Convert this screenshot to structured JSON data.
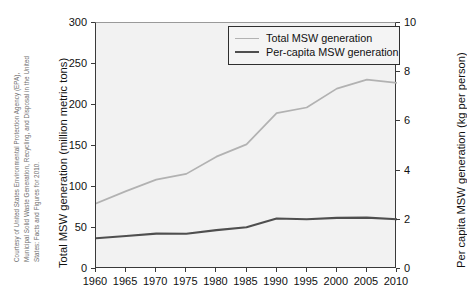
{
  "credit": {
    "line1": "Courtesy of United States Environmental Protection Agency (EPA),",
    "line2": "Municipal Solid Waste Generation, Recycling, and Disposal in the United",
    "line3": "States: Facts and Figures for 2010."
  },
  "legend": {
    "position": "top-right",
    "entries": [
      {
        "label": "Total MSW generation",
        "color": "#b2b2b2",
        "swatch": "total"
      },
      {
        "label": "Per-capita MSW generation",
        "color": "#4f4f4f",
        "swatch": "percapita"
      }
    ]
  },
  "colors": {
    "total_series": "#b2b2b2",
    "percapita_series": "#4f4f4f",
    "plot_background": "#f2f2f2",
    "axis": "#3a3a3a",
    "text": "#111111",
    "credit_text": "#6d6d6d"
  },
  "chart_data": {
    "type": "line",
    "title": "",
    "subtitle": "",
    "xlabel": "",
    "ylabel": "Total MSW generation (million metric tons)",
    "y2label": "Per capita MSW generation (kg per person)",
    "grid": false,
    "xlim": [
      1960,
      2010
    ],
    "ylim": [
      0,
      300
    ],
    "y2lim": [
      0,
      10
    ],
    "xticks": [
      1960,
      1965,
      1970,
      1975,
      1980,
      1985,
      1990,
      1995,
      2000,
      2005,
      2010
    ],
    "yticks": [
      0,
      50,
      100,
      150,
      200,
      250,
      300
    ],
    "y2ticks": [
      0,
      2,
      4,
      6,
      8,
      10
    ],
    "x": [
      1960,
      1965,
      1970,
      1975,
      1980,
      1985,
      1990,
      1995,
      2000,
      2005,
      2010
    ],
    "series": [
      {
        "name": "Total MSW generation",
        "axis": "left",
        "unit": "million metric tons",
        "values": [
          80,
          95,
          109,
          116,
          137,
          152,
          190,
          197,
          220,
          231,
          227
        ]
      },
      {
        "name": "Per-capita MSW generation",
        "axis": "right",
        "unit": "kg per person",
        "values": [
          1.25,
          1.34,
          1.44,
          1.43,
          1.58,
          1.7,
          2.05,
          2.02,
          2.08,
          2.09,
          2.02
        ]
      }
    ]
  }
}
